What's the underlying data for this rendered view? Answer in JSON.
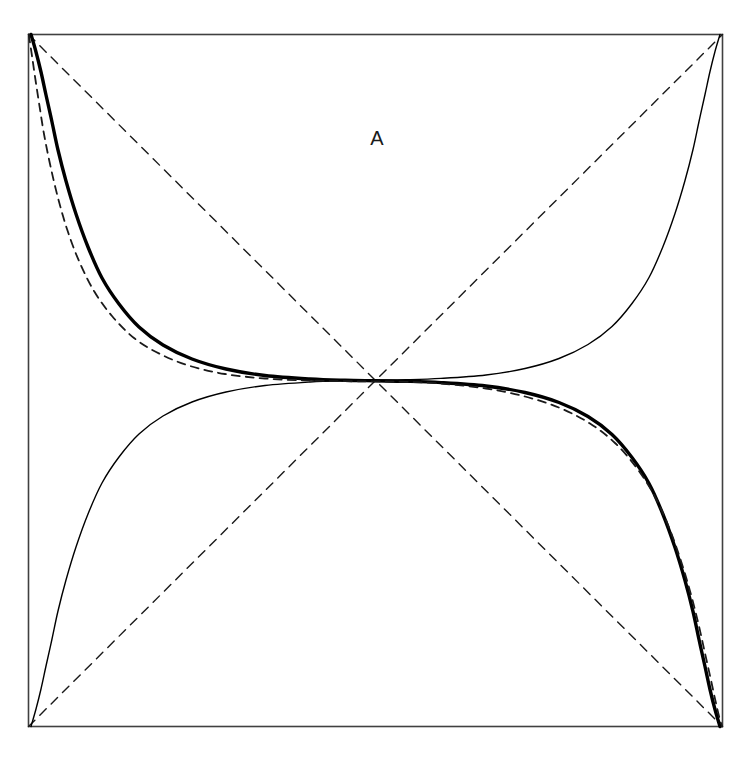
{
  "figure": {
    "kind": "geometric-diagram",
    "title": "",
    "background_color": "#ffffff",
    "width": 751,
    "height": 758
  },
  "frame": {
    "name": "square-border",
    "x": 28.5,
    "y": 34.5,
    "width": 694,
    "height": 692,
    "stroke_color": "#404040",
    "stroke_width": 1.6,
    "fill": "none"
  },
  "labels": [
    {
      "id": "label-a",
      "text": "A",
      "x": 377,
      "y": 140,
      "font_size": 20,
      "color": "#1a1a1a"
    }
  ],
  "geometry": {
    "center": {
      "x": 375.5,
      "y": 380.5
    },
    "corners": {
      "top_left": {
        "x": 28.5,
        "y": 34.5
      },
      "top_right": {
        "x": 722.5,
        "y": 34.5
      },
      "bottom_left": {
        "x": 28.5,
        "y": 726.5
      },
      "bottom_right": {
        "x": 722.5,
        "y": 726.5
      }
    }
  },
  "chart_data": {
    "type": "line",
    "title": "",
    "xlabel": "",
    "ylabel": "",
    "grid": false,
    "legend": false,
    "axis_box": {
      "x0": 28.5,
      "y0": 34.5,
      "x1": 722.5,
      "y1": 726.5
    },
    "annotations": [
      {
        "text": "A",
        "x": 377,
        "y": 140
      }
    ],
    "series": [
      {
        "name": "diagonal-tl-br",
        "style": "dashed",
        "stroke": "#1a1a1a",
        "stroke_width": 1.4,
        "dash": "9 7",
        "points": [
          [
            28.5,
            34.5
          ],
          [
            722.5,
            726.5
          ]
        ]
      },
      {
        "name": "diagonal-bl-tr",
        "style": "dashed",
        "stroke": "#1a1a1a",
        "stroke_width": 1.4,
        "dash": "9 7",
        "points": [
          [
            28.5,
            726.5
          ],
          [
            722.5,
            34.5
          ]
        ]
      },
      {
        "name": "thick-curve",
        "style": "solid",
        "stroke": "#000000",
        "stroke_width": 3.4,
        "description": "heavy curve from top-left corner through centre to bottom-right corner",
        "points": [
          [
            31.0,
            34.5
          ],
          [
            36.0,
            52.0
          ],
          [
            41.0,
            72.0
          ],
          [
            46.0,
            95.0
          ],
          [
            52.0,
            122.0
          ],
          [
            58.0,
            150.0
          ],
          [
            66.0,
            181.0
          ],
          [
            76.0,
            214.0
          ],
          [
            88.0,
            247.0
          ],
          [
            102.0,
            278.0
          ],
          [
            119.0,
            304.0
          ],
          [
            139.0,
            327.0
          ],
          [
            163.0,
            345.0
          ],
          [
            192.0,
            359.0
          ],
          [
            226.0,
            369.0
          ],
          [
            265.0,
            375.5
          ],
          [
            310.0,
            379.0
          ],
          [
            345.0,
            380.3
          ],
          [
            375.5,
            380.8
          ],
          [
            406.0,
            381.3
          ],
          [
            441.0,
            382.6
          ],
          [
            486.0,
            386.0
          ],
          [
            525.0,
            392.5
          ],
          [
            559.0,
            402.5
          ],
          [
            588.0,
            416.5
          ],
          [
            612.0,
            434.5
          ],
          [
            632.0,
            457.5
          ],
          [
            649.0,
            483.5
          ],
          [
            663.0,
            514.5
          ],
          [
            675.0,
            547.5
          ],
          [
            685.0,
            580.5
          ],
          [
            693.0,
            611.5
          ],
          [
            699.0,
            639.5
          ],
          [
            705.0,
            666.5
          ],
          [
            710.0,
            689.5
          ],
          [
            715.0,
            709.5
          ],
          [
            720.0,
            726.5
          ]
        ]
      },
      {
        "name": "thin-curve",
        "style": "solid",
        "stroke": "#000000",
        "stroke_width": 1.4,
        "description": "light curve from bottom-left corner through centre to top-right corner (180-degree rotation of the heavy curve)",
        "points": [
          [
            31.0,
            726.5
          ],
          [
            36.0,
            709.0
          ],
          [
            41.0,
            689.0
          ],
          [
            46.0,
            666.0
          ],
          [
            52.0,
            639.0
          ],
          [
            58.0,
            611.0
          ],
          [
            66.0,
            580.0
          ],
          [
            76.0,
            547.0
          ],
          [
            88.0,
            514.0
          ],
          [
            102.0,
            483.0
          ],
          [
            119.0,
            457.0
          ],
          [
            139.0,
            434.0
          ],
          [
            163.0,
            416.0
          ],
          [
            192.0,
            402.0
          ],
          [
            226.0,
            392.0
          ],
          [
            265.0,
            385.5
          ],
          [
            310.0,
            382.0
          ],
          [
            345.0,
            380.7
          ],
          [
            375.5,
            380.2
          ],
          [
            406.0,
            379.7
          ],
          [
            441.0,
            378.4
          ],
          [
            486.0,
            375.0
          ],
          [
            525.0,
            368.5
          ],
          [
            559.0,
            358.5
          ],
          [
            588.0,
            344.5
          ],
          [
            612.0,
            326.5
          ],
          [
            632.0,
            303.5
          ],
          [
            649.0,
            277.5
          ],
          [
            663.0,
            246.5
          ],
          [
            675.0,
            213.5
          ],
          [
            685.0,
            180.5
          ],
          [
            693.0,
            149.5
          ],
          [
            699.0,
            121.5
          ],
          [
            705.0,
            94.5
          ],
          [
            710.0,
            71.5
          ],
          [
            715.0,
            51.5
          ],
          [
            720.0,
            34.5
          ]
        ]
      },
      {
        "name": "dashed-approx-curve",
        "style": "dashed",
        "stroke": "#1a1a1a",
        "stroke_width": 1.8,
        "dash": "8 6",
        "description": "dashed comparison curve tracking just outside the heavy curve, corner to corner",
        "points": [
          [
            28.8,
            34.5
          ],
          [
            32.0,
            56.0
          ],
          [
            35.5,
            80.0
          ],
          [
            39.5,
            106.0
          ],
          [
            44.0,
            134.0
          ],
          [
            50.0,
            164.0
          ],
          [
            57.5,
            196.0
          ],
          [
            67.0,
            229.0
          ],
          [
            79.0,
            261.0
          ],
          [
            94.0,
            291.0
          ],
          [
            112.0,
            316.0
          ],
          [
            134.0,
            338.0
          ],
          [
            160.0,
            354.0
          ],
          [
            190.0,
            366.0
          ],
          [
            225.0,
            374.0
          ],
          [
            265.0,
            378.5
          ],
          [
            310.0,
            380.6
          ],
          [
            345.0,
            381.2
          ],
          [
            375.5,
            381.4
          ],
          [
            406.0,
            381.8
          ],
          [
            441.0,
            383.6
          ],
          [
            486.0,
            388.5
          ],
          [
            525.0,
            396.5
          ],
          [
            560.0,
            408.0
          ],
          [
            590.0,
            423.5
          ],
          [
            615.0,
            443.0
          ],
          [
            636.0,
            467.0
          ],
          [
            653.5,
            494.0
          ],
          [
            668.0,
            525.0
          ],
          [
            680.0,
            558.0
          ],
          [
            690.0,
            591.0
          ],
          [
            698.0,
            622.0
          ],
          [
            704.5,
            651.0
          ],
          [
            710.5,
            678.0
          ],
          [
            715.5,
            701.0
          ],
          [
            719.5,
            718.0
          ],
          [
            722.2,
            726.5
          ]
        ]
      }
    ]
  }
}
